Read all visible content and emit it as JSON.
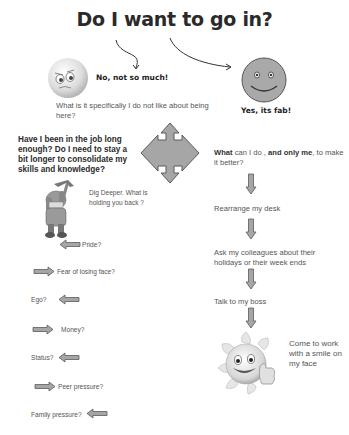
{
  "title": "Do I want to go in?",
  "branches": {
    "no": {
      "label": "No, not so much!",
      "question": "What is it specifically I do not like about being here?"
    },
    "yes": {
      "label": "Yes, its fab!",
      "question_bold_1": "What",
      "question_mid": " can I do , ",
      "question_bold_2": "and only me",
      "question_end": ", to make it better?"
    }
  },
  "center": {
    "question": "Have I been in the job long enough? Do I need to stay a bit longer to consolidate my skills and knowledge?"
  },
  "dig_deeper": "Dig Deeper. What is holding you back ?",
  "reasons": [
    {
      "label": "Pride?",
      "arrow": "left"
    },
    {
      "label": "Fear of  losing face?",
      "arrow": "right"
    },
    {
      "label": "Ego?",
      "arrow": "left"
    },
    {
      "label": "Money?",
      "arrow": "right"
    },
    {
      "label": "Status?",
      "arrow": "left"
    },
    {
      "label": "Peer pressure?",
      "arrow": "right"
    },
    {
      "label": "Family pressure?",
      "arrow": "left"
    }
  ],
  "steps": [
    {
      "label": "Rearrange my desk"
    },
    {
      "label": "Ask my colleagues about their holidays or their week ends"
    },
    {
      "label": "Talk to my boss"
    },
    {
      "label": "Come to work with a smile on my face"
    }
  ],
  "icons": {
    "sad_face": "sad-face-icon",
    "happy_face": "smiley-face-icon",
    "cross_arrows": "four-way-arrow-icon",
    "miner": "miner-digging-icon",
    "sun_thumbs_up": "sun-thumbs-up-icon"
  },
  "colors": {
    "arrow_fill": "#a6a6a6",
    "arrow_stroke": "#5a5a5a",
    "smiley_fill": "#a9a9a9",
    "text": "#333333"
  }
}
